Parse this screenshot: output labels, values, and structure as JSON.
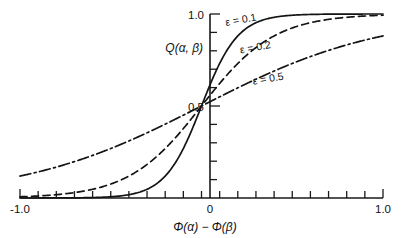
{
  "chart_data": {
    "type": "line",
    "title": "",
    "subtitle": "",
    "xlabel": "Φ(α) − Φ(β)",
    "ylabel": "Q(α, β)",
    "xlim": [
      -1.0,
      1.0
    ],
    "ylim": [
      0.0,
      1.0
    ],
    "grid": false,
    "legend_position": "inline-annotations",
    "x_tick_labels": [
      "-1.0",
      "0",
      "1.0"
    ],
    "x_tick_label_values": [
      -1.0,
      0.0,
      1.0
    ],
    "x_minor_tick_step": 0.1,
    "y_tick_labels": [
      "0.5",
      "1.0"
    ],
    "y_tick_label_values": [
      0.5,
      1.0
    ],
    "y_minor_tick_step": 0.1,
    "x": [
      -1.0,
      -0.95,
      -0.9,
      -0.85,
      -0.8,
      -0.75,
      -0.7,
      -0.65,
      -0.6,
      -0.55,
      -0.5,
      -0.45,
      -0.4,
      -0.35,
      -0.3,
      -0.25,
      -0.2,
      -0.15,
      -0.1,
      -0.05,
      0.0,
      0.05,
      0.1,
      0.15,
      0.2,
      0.25,
      0.3,
      0.35,
      0.4,
      0.45,
      0.5,
      0.55,
      0.6,
      0.65,
      0.7,
      0.75,
      0.8,
      0.85,
      0.9,
      0.95,
      1.0
    ],
    "series": [
      {
        "name": "ε = 0.1",
        "epsilon": 0.1,
        "style": "solid",
        "label": "ε = 0.1",
        "label_x": 0.22,
        "label_y": 0.95,
        "values": [
          0.0,
          0.0,
          0.0001,
          0.0002,
          0.0003,
          0.0006,
          0.0009,
          0.0015,
          0.0025,
          0.0041,
          0.0067,
          0.011,
          0.018,
          0.0293,
          0.0474,
          0.0759,
          0.1192,
          0.1824,
          0.2689,
          0.3775,
          0.5,
          0.6225,
          0.7311,
          0.8176,
          0.8808,
          0.9241,
          0.9526,
          0.9707,
          0.982,
          0.989,
          0.9933,
          0.9959,
          0.9975,
          0.9985,
          0.9991,
          0.9994,
          0.9997,
          0.9998,
          0.9999,
          1.0,
          1.0
        ]
      },
      {
        "name": "ε = 0.2",
        "epsilon": 0.2,
        "style": "dashed",
        "label": "ε = 0.2",
        "label_x": 0.3,
        "label_y": 0.8,
        "values": [
          0.0067,
          0.0087,
          0.011,
          0.0141,
          0.018,
          0.0228,
          0.0293,
          0.037,
          0.0474,
          0.0601,
          0.0759,
          0.0953,
          0.1192,
          0.148,
          0.1824,
          0.2227,
          0.2689,
          0.3208,
          0.3775,
          0.4378,
          0.5,
          0.5622,
          0.6225,
          0.6792,
          0.7311,
          0.7773,
          0.8176,
          0.852,
          0.8808,
          0.9047,
          0.9241,
          0.9399,
          0.9526,
          0.963,
          0.9707,
          0.9772,
          0.982,
          0.9859,
          0.989,
          0.9913,
          0.9933
        ]
      },
      {
        "name": "ε = 0.5",
        "epsilon": 0.5,
        "style": "dashdot",
        "label": "ε = 0.5",
        "label_x": 0.37,
        "label_y": 0.63,
        "values": [
          0.1192,
          0.1301,
          0.1419,
          0.1545,
          0.168,
          0.1824,
          0.1978,
          0.2142,
          0.2315,
          0.2497,
          0.2689,
          0.2891,
          0.31,
          0.3318,
          0.3543,
          0.3775,
          0.4013,
          0.4256,
          0.4502,
          0.475,
          0.5,
          0.525,
          0.5498,
          0.5744,
          0.5987,
          0.6225,
          0.6457,
          0.6682,
          0.69,
          0.7109,
          0.7311,
          0.7503,
          0.7685,
          0.7858,
          0.8022,
          0.8176,
          0.832,
          0.8455,
          0.8581,
          0.8699,
          0.8808
        ]
      }
    ]
  },
  "labels": {
    "y_axis_title": "Q(α, β)",
    "x_axis_title": "Φ(α) − Φ(β)",
    "x_min_label": "-1.0",
    "x_zero_label": "0",
    "x_max_label": "1.0",
    "y_half_label": "0.5",
    "y_max_label": "1.0",
    "series_1_label": "ε = 0.1",
    "series_2_label": "ε = 0.2",
    "series_3_label": "ε = 0.5"
  }
}
